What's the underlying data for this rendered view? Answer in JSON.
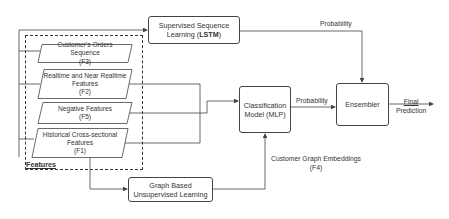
{
  "diagram": {
    "nodes": {
      "lstm": {
        "line1": "Supervised Sequence",
        "line2_prefix": "Learning (",
        "line2_bold": "LSTM",
        "line2_suffix": ")"
      },
      "features_container": {
        "label": "Features"
      },
      "f3": {
        "line1": "Customer's Orders Sequence",
        "line2": "(F3)"
      },
      "f2": {
        "line1": "Realtime and  Near Realtime",
        "line2": "Features",
        "line3": "(F2)"
      },
      "f5": {
        "line1": "Negative Features",
        "line2": "(F5)"
      },
      "f1": {
        "line1": "Historical Cross-sectional",
        "line2": "Features",
        "line3": "(F1)"
      },
      "mlp": {
        "line1": "Classification",
        "line2": "Model (MLP)"
      },
      "ensembler": {
        "label": "Ensembler"
      },
      "graph": {
        "line1": "Graph Based",
        "line2": "Unsupervised Learning"
      }
    },
    "edge_labels": {
      "lstm_to_ensembler": "Probability",
      "mlp_to_ensembler": "Probability",
      "final_line1": "Final",
      "final_line2": "Prediction",
      "graph_embeddings_line1": "Customer Graph Embeddings",
      "graph_embeddings_line2": "(F4)"
    },
    "colors": {
      "stroke": "#444444",
      "text": "#333333",
      "background": "#ffffff"
    }
  }
}
